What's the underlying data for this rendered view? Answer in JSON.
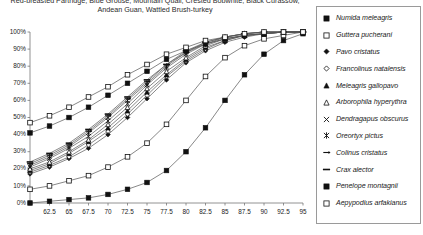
{
  "title": {
    "line1": "Red-breasted Partridge, Blue Grouse, Mountain Quail, Crested Bobwhite, Black Curassow,",
    "line2": "Andean Guan, Wattled Brush-turkey"
  },
  "chart_data": {
    "type": "line",
    "title": "Red-breasted Partridge, Blue Grouse, Mountain Quail, Crested Bobwhite, Black Curassow, Andean Guan, Wattled Brush-turkey",
    "xlabel": "",
    "ylabel": "",
    "grid": false,
    "legend_position": "right",
    "xlim": [
      60,
      95
    ],
    "ylim": [
      0,
      100
    ],
    "x": [
      60,
      62.5,
      65,
      67.5,
      70,
      72.5,
      75,
      77.5,
      80,
      82.5,
      85,
      87.5,
      90,
      92.5,
      95
    ],
    "xticks": [
      "",
      "62.5",
      "65",
      "67.5",
      "70",
      "72.5",
      "75",
      "77.5",
      "80",
      "82.5",
      "85",
      "87.5",
      "90",
      "92.5",
      "95"
    ],
    "yticks": [
      "0%",
      "10%",
      "20%",
      "30%",
      "40%",
      "50%",
      "60%",
      "70%",
      "80%",
      "90%",
      "100%"
    ],
    "series": [
      {
        "name": "Numida meleagris",
        "marker": "filled-square",
        "values": [
          0,
          1,
          2,
          3,
          5,
          8,
          12,
          19,
          30,
          44,
          60,
          75,
          87,
          95,
          99
        ]
      },
      {
        "name": "Guttera pucherani",
        "marker": "open-square",
        "values": [
          8,
          10,
          13,
          16,
          21,
          27,
          35,
          46,
          60,
          74,
          85,
          92,
          96,
          98,
          100
        ]
      },
      {
        "name": "Pavo cristatus",
        "marker": "filled-diamond",
        "values": [
          17,
          21,
          26,
          32,
          40,
          50,
          61,
          72,
          82,
          89,
          94,
          97,
          99,
          100,
          100
        ]
      },
      {
        "name": "Francolinus natalensis",
        "marker": "open-diamond",
        "values": [
          18,
          22,
          27,
          34,
          42,
          52,
          63,
          74,
          83,
          90,
          95,
          98,
          99,
          100,
          100
        ]
      },
      {
        "name": "Meleagris gallopavo",
        "marker": "filled-triangle",
        "values": [
          19,
          23,
          29,
          36,
          44,
          54,
          65,
          75,
          84,
          91,
          95,
          98,
          99,
          100,
          100
        ]
      },
      {
        "name": "Arborophila hyperythra",
        "marker": "open-triangle",
        "values": [
          20,
          24,
          30,
          37,
          46,
          56,
          67,
          77,
          85,
          92,
          96,
          98,
          99,
          100,
          100
        ]
      },
      {
        "name": "Dendragapus obscurus",
        "marker": "cross-x",
        "values": [
          21,
          26,
          32,
          39,
          48,
          58,
          69,
          79,
          87,
          93,
          96,
          98,
          99,
          100,
          100
        ]
      },
      {
        "name": "Oreortyx pictus",
        "marker": "star-x",
        "values": [
          22,
          27,
          33,
          41,
          50,
          60,
          70,
          80,
          88,
          93,
          97,
          99,
          100,
          100,
          100
        ]
      },
      {
        "name": "Colinus cristatus",
        "marker": "dash-arrow",
        "values": [
          23,
          28,
          34,
          42,
          51,
          61,
          71,
          81,
          88,
          94,
          97,
          99,
          100,
          100,
          100
        ]
      },
      {
        "name": "Crax alector",
        "marker": "dash-bar",
        "values": [
          24,
          29,
          35,
          43,
          52,
          62,
          72,
          81,
          89,
          94,
          97,
          99,
          100,
          100,
          100
        ]
      },
      {
        "name": "Penelope montagnii",
        "marker": "filled-square",
        "values": [
          41,
          45,
          50,
          56,
          63,
          70,
          77,
          84,
          89,
          93,
          96,
          98,
          99,
          100,
          100
        ]
      },
      {
        "name": "Aepypodius arfakianus",
        "marker": "open-square",
        "values": [
          47,
          51,
          56,
          62,
          68,
          75,
          81,
          87,
          91,
          95,
          97,
          99,
          100,
          100,
          100
        ]
      }
    ]
  },
  "legend": {
    "items": [
      {
        "label": "Numida meleagris",
        "marker": "filled-square"
      },
      {
        "label": "Guttera pucherani",
        "marker": "open-square"
      },
      {
        "label": "Pavo cristatus",
        "marker": "filled-diamond"
      },
      {
        "label": "Francolinus natalensis",
        "marker": "open-diamond"
      },
      {
        "label": "Meleagris gallopavo",
        "marker": "filled-triangle"
      },
      {
        "label": "Arborophila hyperythra",
        "marker": "open-triangle"
      },
      {
        "label": "Dendragapus obscurus",
        "marker": "cross-x"
      },
      {
        "label": "Oreortyx pictus",
        "marker": "star-x"
      },
      {
        "label": "Colinus cristatus",
        "marker": "dash-arrow"
      },
      {
        "label": "Crax alector",
        "marker": "dash-bar"
      },
      {
        "label": "Penelope montagnii",
        "marker": "filled-square"
      },
      {
        "label": "Aepypodius arfakianus",
        "marker": "open-square"
      }
    ]
  },
  "colors": {
    "line": "#555555",
    "marker_fill": "#111111",
    "marker_stroke": "#111111",
    "axis": "#777777",
    "legend_border": "#9a9a9a"
  }
}
